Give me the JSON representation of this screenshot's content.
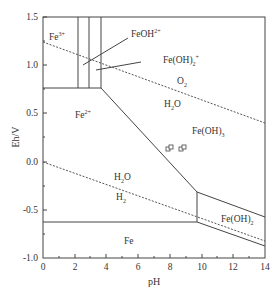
{
  "diagram": {
    "type": "Pourbaix (Eh-pH) diagram for Fe-H2O system",
    "xlabel": "pH",
    "ylabel": "Eh/V",
    "x_ticks": [
      "0",
      "2",
      "4",
      "6",
      "8",
      "10",
      "12",
      "14"
    ],
    "y_ticks": [
      "1.5",
      "1.0",
      "0.5",
      "0.0",
      "-0.5",
      "-1.0"
    ],
    "xlim": [
      0,
      14
    ],
    "ylim": [
      -1.0,
      1.5
    ],
    "regions": [
      {
        "label": "Fe",
        "sup": "3+",
        "text": "Fe3+"
      },
      {
        "label": "FeOH",
        "sup": "2+",
        "text": "FeOH2+"
      },
      {
        "label": "Fe(OH)",
        "sub": "2",
        "sup": "+",
        "text": "Fe(OH)2+"
      },
      {
        "label": "Fe",
        "sup": "2+",
        "text": "Fe2+"
      },
      {
        "label": "Fe(OH)",
        "sub": "3",
        "text": "Fe(OH)3"
      },
      {
        "label": "Fe(OH)",
        "sub": "2",
        "text": "Fe(OH)2"
      },
      {
        "label": "Fe",
        "text": "Fe"
      }
    ],
    "water_lines": {
      "upper": {
        "above": "O2",
        "below": "H2O"
      },
      "lower": {
        "above": "H2O",
        "below": "H2"
      }
    },
    "labels": {
      "fe3": "Fe",
      "fe3_sup": "3+",
      "feoh": "FeOH",
      "feoh_sup": "2+",
      "feoh2": "Fe(OH)",
      "feoh2_sub": "2",
      "feoh2_sup": "+",
      "fe2": "Fe",
      "fe2_sup": "2+",
      "o2": "O",
      "o2_sub": "2",
      "h2o_upper": "H",
      "h2o_upper_sub": "2",
      "h2o_upper_tail": "O",
      "feoh3": "Fe(OH)",
      "feoh3_sub": "3",
      "h2o_lower": "H",
      "h2o_lower_sub": "2",
      "h2o_lower_tail": "O",
      "h2": "H",
      "h2_sub": "2",
      "feoh2s": "Fe(OH)",
      "feoh2s_sub": "2",
      "fe": "Fe"
    },
    "markers": [
      {
        "shape": "square-pair",
        "pH": 8.0,
        "Eh": 0.13
      },
      {
        "shape": "square-pair",
        "pH": 8.8,
        "Eh": 0.14
      }
    ]
  }
}
